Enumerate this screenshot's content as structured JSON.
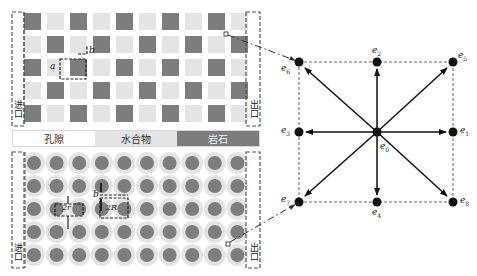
{
  "legend": {
    "pore": "孔隙",
    "hydrate": "水合物",
    "rock": "岩石"
  },
  "panels": {
    "top": {
      "inlet_label": "进口",
      "outlet_label": "出口",
      "annotations": {
        "a": "a",
        "b": "b"
      },
      "rows": 5,
      "cols": 10
    },
    "bottom": {
      "inlet_label": "进口",
      "outlet_label": "出口",
      "annotations": {
        "two_r": "2r",
        "two_R": "2R",
        "b": "b"
      },
      "rows": 5,
      "cols": 10
    }
  },
  "lattice": {
    "name": "D2Q9",
    "labels": {
      "e0": "e",
      "e0_sub": "0",
      "e1": "e",
      "e1_sub": "1",
      "e2": "e",
      "e2_sub": "2",
      "e3": "e",
      "e3_sub": "3",
      "e4": "e",
      "e4_sub": "4",
      "e5": "e",
      "e5_sub": "5",
      "e6": "e",
      "e6_sub": "6",
      "e7": "e",
      "e7_sub": "7",
      "e8": "e",
      "e8_sub": "8"
    }
  },
  "colors": {
    "rock": "#7d7d7d",
    "hydrate": "#e4e4e4",
    "pore": "#ffffff",
    "node": "#111111"
  }
}
